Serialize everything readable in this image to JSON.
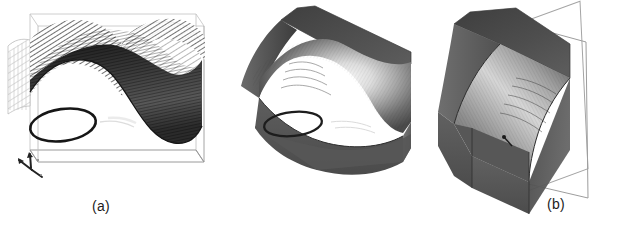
{
  "figure": {
    "title": "",
    "background_color": "#ffffff",
    "width": 630,
    "height": 229,
    "panel_count": 3
  },
  "panels": [
    {
      "id": "a",
      "caption": "(a)",
      "rendering_style": "wireframe-mesh-surface-in-bounding-box",
      "description": "Saddle-shaped trough surface drawn as a dense hatched wireframe mesh inside a thin rectangular bounding box, with a dark ellipse annotation marking a region on the lower left of the trough floor",
      "has_bounding_box": true,
      "has_ellipse_annotation": true,
      "axis_triad": "axis-triad-icon",
      "colors": {
        "mesh_dark": "#2a2a2a",
        "mesh_mid": "#6e6e6e",
        "mesh_light": "#b9b9b9",
        "box_line": "#9a9a9a",
        "ellipse": "#1a1a1a"
      }
    },
    {
      "id": "b",
      "caption": "(b)",
      "rendering_style": "shaded-solid-block",
      "description": "Same saddle trough rendered as a smooth shaded gray solid block with a bright specular highlight across the trough floor and a dark ellipse annotation on the lower left",
      "has_bounding_box": false,
      "has_ellipse_annotation": true,
      "axis_triad": "axis-triad-icon",
      "colors": {
        "top_face_dark": "#4a4a4a",
        "trough_highlight": "#f2f2f2",
        "front_face": "#565656",
        "side_face": "#6b6b6b",
        "ellipse": "#1c1c1c"
      }
    },
    {
      "id": "c",
      "caption": "(c)",
      "rendering_style": "shaded-solid-block-with-cut-plane",
      "description": "Cropped shaded solid block viewed end-on showing the curved concave wall, with a thin outlined parallelogram cutting plane passing through it",
      "has_bounding_box": false,
      "has_cut_plane": true,
      "has_ellipse_annotation": false,
      "axis_triad": "axis-triad-icon",
      "colors": {
        "top_face_dark": "#4c4c4c",
        "curved_face_light": "#d8d8d8",
        "front_face": "#5a5a5a",
        "plane_line": "#8f8f8f"
      }
    }
  ],
  "annotations": {
    "axis_triad_label": "coordinate axis triad",
    "ellipse_label": "highlighted region"
  }
}
